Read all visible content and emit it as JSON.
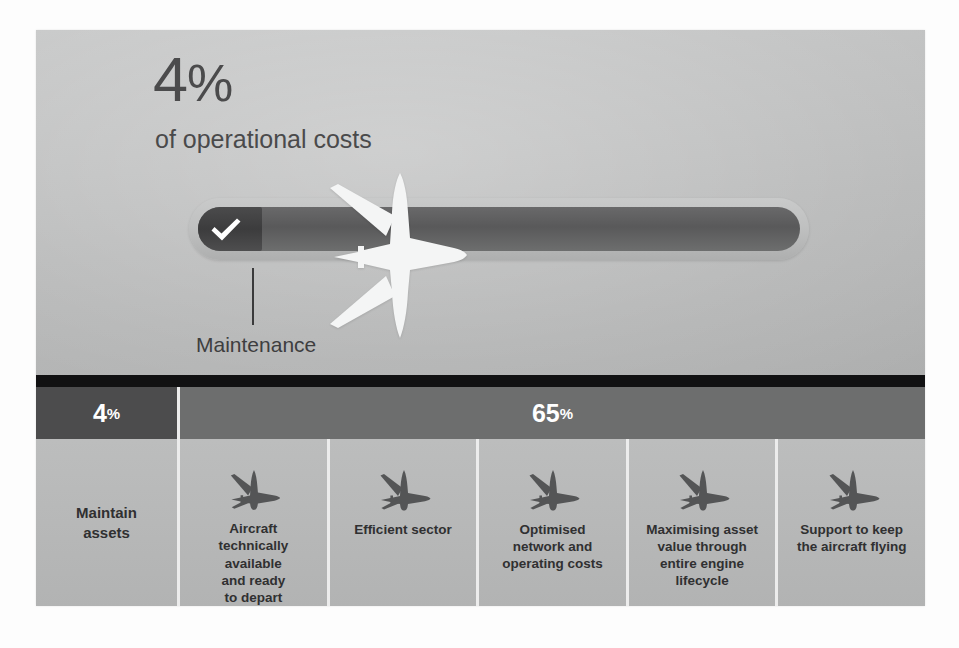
{
  "hero": {
    "big_stat_number": "4",
    "big_stat_percent": "%",
    "subtitle": "of operational costs",
    "callout_label": "Maintenance",
    "check_icon": "check-icon",
    "plane_icon": "airplane-silhouette-icon"
  },
  "header_row": {
    "left": {
      "number": "4",
      "percent": "%"
    },
    "right": {
      "number": "65",
      "percent": "%"
    }
  },
  "cards": [
    {
      "label": "Maintain\nassets",
      "icon": null
    },
    {
      "label": "Aircraft\ntechnically\navailable\nand ready\nto depart",
      "icon": "airplane-icon"
    },
    {
      "label": "Efficient sector",
      "icon": "airplane-icon"
    },
    {
      "label": "Optimised\nnetwork and\noperating costs",
      "icon": "airplane-icon"
    },
    {
      "label": "Maximising asset\nvalue through\nentire engine\nlifecycle",
      "icon": "airplane-icon"
    },
    {
      "label": "Support to keep\nthe aircraft flying",
      "icon": "airplane-icon"
    }
  ],
  "colors": {
    "slide_bg": "#b7b8b8",
    "band_dark": "#111112",
    "header_left": "#4c4c4d",
    "header_right": "#6d6e6e",
    "bar_track": "#59595a",
    "bar_fill": "#3c3c3d",
    "divider": "#ececec",
    "text_dark": "#303031"
  }
}
